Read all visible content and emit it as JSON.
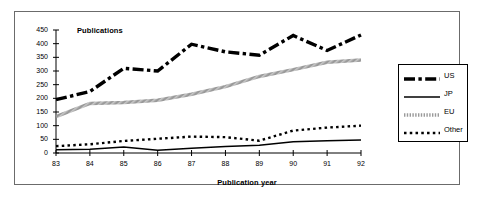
{
  "chart_data": {
    "type": "line",
    "title": "",
    "xlabel": "Publication year",
    "ylabel": "Publications",
    "x": [
      "83",
      "84",
      "85",
      "86",
      "87",
      "88",
      "89",
      "90",
      "91",
      "92"
    ],
    "categories": [
      "83",
      "84",
      "85",
      "86",
      "87",
      "88",
      "89",
      "90",
      "91",
      "92"
    ],
    "xlim": [
      83,
      92
    ],
    "ylim": [
      0,
      450
    ],
    "yticks": [
      0,
      50,
      100,
      150,
      200,
      250,
      300,
      350,
      400,
      450
    ],
    "xticks": [
      "83",
      "84",
      "85",
      "86",
      "87",
      "88",
      "89",
      "90",
      "91",
      "92"
    ],
    "grid": false,
    "legend_position": "right",
    "series": [
      {
        "name": "US",
        "values": [
          195,
          225,
          310,
          300,
          398,
          370,
          358,
          430,
          375,
          432
        ],
        "color": "#000000",
        "style": "dash-dot-thick",
        "linewidth": 3.4
      },
      {
        "name": "JP",
        "values": [
          12,
          14,
          22,
          10,
          17,
          24,
          28,
          41,
          45,
          48
        ],
        "color": "#000000",
        "style": "solid",
        "linewidth": 1.5
      },
      {
        "name": "EU",
        "values": [
          133,
          181,
          185,
          193,
          215,
          243,
          280,
          305,
          332,
          340
        ],
        "color": "#9a9a9a",
        "style": "hatched",
        "linewidth": 3.4
      },
      {
        "name": "Other",
        "values": [
          25,
          32,
          44,
          52,
          60,
          58,
          45,
          82,
          93,
          100
        ],
        "color": "#000000",
        "style": "dotted",
        "linewidth": 2.4
      }
    ]
  },
  "legend": {
    "items": [
      {
        "label": "US"
      },
      {
        "label": "JP"
      },
      {
        "label": "EU"
      },
      {
        "label": "Other"
      }
    ]
  }
}
